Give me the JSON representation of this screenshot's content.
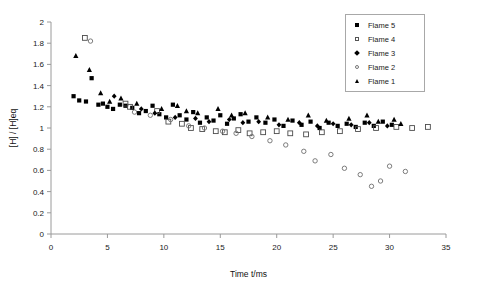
{
  "chart_data": {
    "type": "scatter",
    "title": "",
    "xlabel": "Time t/ms",
    "ylabel": "[H] / [H]eq",
    "xlim": [
      0,
      35
    ],
    "ylim": [
      0,
      2
    ],
    "xticks": [
      0,
      5,
      10,
      15,
      20,
      25,
      30,
      35
    ],
    "yticks": [
      0,
      0.2,
      0.4,
      0.6,
      0.8,
      1,
      1.2,
      1.4,
      1.6,
      1.8,
      2
    ],
    "xtick_labels": [
      "0",
      "5",
      "10",
      "15",
      "20",
      "25",
      "30",
      "35"
    ],
    "ytick_labels": [
      "0",
      "0.2",
      "0.4",
      "0.6",
      "0.8",
      "1",
      "1.2",
      "1.4",
      "1.6",
      "1.8",
      "2"
    ],
    "grid": false,
    "legend_position": "top-right",
    "marker_color": "#000000",
    "axis_color": "#9a9a9a",
    "series": [
      {
        "name": "Flame 5",
        "marker": "filled-square",
        "points": [
          [
            2.0,
            1.3
          ],
          [
            2.5,
            1.26
          ],
          [
            3.1,
            1.25
          ],
          [
            3.6,
            1.47
          ],
          [
            4.2,
            1.22
          ],
          [
            4.6,
            1.23
          ],
          [
            5.0,
            1.2
          ],
          [
            5.5,
            1.18
          ],
          [
            6.1,
            1.22
          ],
          [
            6.6,
            1.21
          ],
          [
            7.2,
            1.19
          ],
          [
            7.8,
            1.14
          ],
          [
            8.4,
            1.16
          ],
          [
            9.0,
            1.21
          ],
          [
            9.6,
            1.13
          ],
          [
            10.2,
            1.1
          ],
          [
            10.8,
            1.22
          ],
          [
            11.4,
            1.12
          ],
          [
            12.0,
            1.08
          ],
          [
            12.6,
            1.15
          ],
          [
            13.2,
            1.05
          ],
          [
            13.8,
            1.1
          ],
          [
            14.4,
            1.07
          ],
          [
            15.0,
            1.12
          ],
          [
            15.6,
            1.04
          ],
          [
            16.2,
            1.09
          ],
          [
            16.8,
            1.13
          ],
          [
            17.5,
            1.06
          ],
          [
            18.2,
            1.1
          ],
          [
            19.0,
            1.05
          ],
          [
            19.8,
            1.08
          ],
          [
            20.6,
            1.02
          ],
          [
            21.4,
            1.07
          ],
          [
            22.2,
            1.03
          ],
          [
            23.0,
            1.06
          ],
          [
            23.8,
            1.0
          ],
          [
            24.6,
            1.05
          ],
          [
            25.4,
            1.02
          ],
          [
            26.2,
            1.04
          ],
          [
            27.0,
            1.01
          ],
          [
            27.8,
            1.05
          ],
          [
            28.6,
            1.02
          ],
          [
            29.4,
            1.06
          ],
          [
            30.2,
            1.03
          ]
        ]
      },
      {
        "name": "Flame 4",
        "marker": "open-square",
        "points": [
          [
            3.0,
            1.85
          ],
          [
            6.6,
            1.23
          ],
          [
            7.0,
            1.2
          ],
          [
            9.4,
            1.16
          ],
          [
            10.4,
            1.06
          ],
          [
            11.6,
            1.04
          ],
          [
            12.4,
            1.0
          ],
          [
            13.4,
            0.99
          ],
          [
            14.6,
            0.97
          ],
          [
            15.4,
            0.96
          ],
          [
            16.6,
            0.98
          ],
          [
            17.6,
            0.95
          ],
          [
            18.8,
            0.96
          ],
          [
            20.0,
            0.97
          ],
          [
            21.2,
            0.95
          ],
          [
            22.6,
            0.94
          ],
          [
            24.0,
            0.96
          ],
          [
            25.6,
            0.97
          ],
          [
            27.2,
            0.99
          ],
          [
            28.8,
            1.0
          ],
          [
            30.6,
            1.01
          ],
          [
            32.0,
            1.0
          ],
          [
            33.4,
            1.01
          ]
        ]
      },
      {
        "name": "Flame 3",
        "marker": "filled-diamond",
        "points": [
          [
            5.6,
            1.3
          ],
          [
            8.0,
            1.18
          ],
          [
            9.2,
            1.14
          ],
          [
            11.0,
            1.1
          ],
          [
            12.8,
            1.09
          ],
          [
            14.0,
            1.06
          ],
          [
            15.8,
            1.08
          ],
          [
            17.0,
            1.05
          ],
          [
            18.4,
            1.06
          ],
          [
            20.2,
            1.03
          ],
          [
            22.0,
            1.05
          ],
          [
            23.6,
            1.02
          ],
          [
            25.0,
            1.04
          ],
          [
            26.6,
            1.03
          ],
          [
            28.2,
            1.05
          ],
          [
            29.8,
            1.02
          ]
        ]
      },
      {
        "name": "Flame 2",
        "marker": "open-circle",
        "points": [
          [
            3.5,
            1.82
          ],
          [
            7.4,
            1.15
          ],
          [
            8.8,
            1.12
          ],
          [
            10.6,
            1.08
          ],
          [
            12.2,
            1.02
          ],
          [
            13.6,
            1.0
          ],
          [
            15.2,
            0.97
          ],
          [
            16.4,
            0.95
          ],
          [
            17.8,
            0.92
          ],
          [
            19.4,
            0.88
          ],
          [
            20.8,
            0.84
          ],
          [
            22.4,
            0.78
          ],
          [
            23.4,
            0.69
          ],
          [
            24.8,
            0.75
          ],
          [
            26.0,
            0.62
          ],
          [
            27.4,
            0.56
          ],
          [
            28.4,
            0.45
          ],
          [
            29.2,
            0.5
          ],
          [
            30.0,
            0.64
          ],
          [
            31.4,
            0.59
          ]
        ]
      },
      {
        "name": "Flame 1",
        "marker": "filled-triangle",
        "points": [
          [
            2.2,
            1.68
          ],
          [
            3.4,
            1.55
          ],
          [
            4.4,
            1.33
          ],
          [
            5.2,
            1.25
          ],
          [
            6.2,
            1.28
          ],
          [
            7.6,
            1.23
          ],
          [
            9.8,
            1.18
          ],
          [
            11.2,
            1.21
          ],
          [
            12.0,
            1.16
          ],
          [
            13.0,
            1.14
          ],
          [
            14.8,
            1.18
          ],
          [
            16.0,
            1.12
          ],
          [
            17.2,
            1.14
          ],
          [
            19.2,
            1.1
          ],
          [
            21.0,
            1.08
          ],
          [
            22.8,
            1.12
          ],
          [
            24.4,
            1.07
          ],
          [
            26.4,
            1.09
          ],
          [
            28.0,
            1.12
          ],
          [
            29.0,
            1.06
          ],
          [
            30.4,
            1.08
          ],
          [
            31.0,
            1.04
          ]
        ]
      }
    ]
  },
  "legend": {
    "items": [
      {
        "label": "Flame 5",
        "marker": "filled-square"
      },
      {
        "label": "Flame 4",
        "marker": "open-square"
      },
      {
        "label": "Flame 3",
        "marker": "filled-diamond"
      },
      {
        "label": "Flame 2",
        "marker": "open-circle"
      },
      {
        "label": "Flame 1",
        "marker": "filled-triangle"
      }
    ]
  }
}
